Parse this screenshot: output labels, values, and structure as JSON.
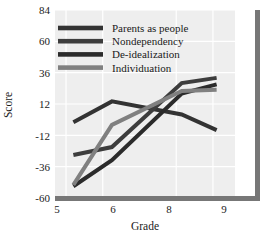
{
  "chart_data": {
    "type": "line",
    "title": "",
    "xlabel": "Grade",
    "ylabel": "Score",
    "x": [
      5,
      6,
      8,
      9
    ],
    "xticklabels": [
      "5",
      "6",
      "8",
      "9"
    ],
    "xlim": [
      4.7,
      9.6
    ],
    "ylim": [
      -60,
      84
    ],
    "yticks": [
      -60,
      -36,
      -12,
      12,
      36,
      60,
      84
    ],
    "yticklabels": [
      "-60",
      "-36",
      "-12",
      "12",
      "36",
      "60",
      "84"
    ],
    "grid": true,
    "legend_position": "upper-left-inside",
    "series": [
      {
        "name": "Parents as people",
        "color": "#333333",
        "x": [
          5.2,
          6.25,
          8.15,
          9.1
        ],
        "values": [
          -2,
          14,
          4,
          -8
        ]
      },
      {
        "name": "Nondependency",
        "color": "#3d3d3d",
        "x": [
          5.2,
          6.25,
          8.15,
          9.1
        ],
        "values": [
          -27,
          -21,
          28,
          32
        ]
      },
      {
        "name": "De-idealization",
        "color": "#2b2b2b",
        "x": [
          5.2,
          6.25,
          8.15,
          9.1
        ],
        "values": [
          -51,
          -31,
          20,
          27
        ]
      },
      {
        "name": "Individuation",
        "color": "#808080",
        "x": [
          5.2,
          6.25,
          8.15,
          9.1
        ],
        "values": [
          -50,
          -4,
          22,
          23
        ]
      }
    ]
  },
  "axes": {
    "ylabel": "Score",
    "xlabel": "Grade",
    "ytick_0": "84",
    "ytick_1": "60",
    "ytick_2": "36",
    "ytick_3": "12",
    "ytick_4": "-12",
    "ytick_5": "-36",
    "ytick_6": "-60",
    "xtick_0": "5",
    "xtick_1": "6",
    "xtick_2": "8",
    "xtick_3": "9"
  },
  "legend": {
    "items": [
      {
        "label": "Parents as people",
        "color": "#333333"
      },
      {
        "label": "Nondependency",
        "color": "#3d3d3d"
      },
      {
        "label": "De-idealization",
        "color": "#2b2b2b"
      },
      {
        "label": "Individuation",
        "color": "#808080"
      }
    ]
  },
  "style": {
    "plot_background": "#eeeeee",
    "grid_color": "#ffffff",
    "axis_color": "#777777",
    "text_color": "#1a1a1a"
  }
}
